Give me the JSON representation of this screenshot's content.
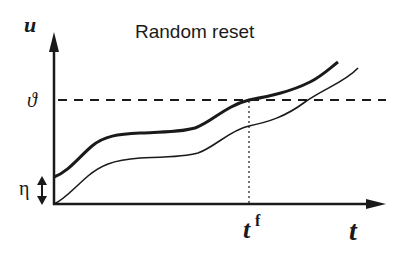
{
  "title": "Random reset",
  "axes": {
    "y_label": "u",
    "x_label": "t"
  },
  "annotations": {
    "threshold_label": "ϑ",
    "reset_noise_label": "η",
    "firing_time_label": "t",
    "firing_time_superscript": "f"
  },
  "colors": {
    "ink": "#1a1a1a",
    "background": "#ffffff"
  },
  "curves": [
    {
      "name": "upper-trajectory",
      "style": "thick"
    },
    {
      "name": "lower-trajectory",
      "style": "thin"
    }
  ]
}
